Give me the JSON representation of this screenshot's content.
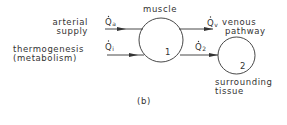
{
  "diagram": {
    "panel_label": "(b)",
    "nodes": [
      {
        "id": "1",
        "label": "muscle",
        "number": "1"
      },
      {
        "id": "2",
        "label": "surrounding tissue",
        "label_lines": [
          "surrounding",
          "tissue"
        ],
        "number": "2"
      }
    ],
    "inputs": [
      {
        "label_lines": [
          "arterial",
          "supply"
        ],
        "symbol": "Q",
        "subscript": "a"
      },
      {
        "label_lines": [
          "thermogenesis",
          "(metabolism)"
        ],
        "symbol": "Q",
        "subscript": "i"
      }
    ],
    "outputs": [
      {
        "label_lines": [
          "venous",
          "pathway"
        ],
        "symbol": "Q",
        "subscript": "v"
      },
      {
        "symbol": "Q",
        "subscript": "2",
        "target": "2"
      }
    ],
    "colors": {
      "stroke": "#333333",
      "background": "#ffffff"
    }
  }
}
